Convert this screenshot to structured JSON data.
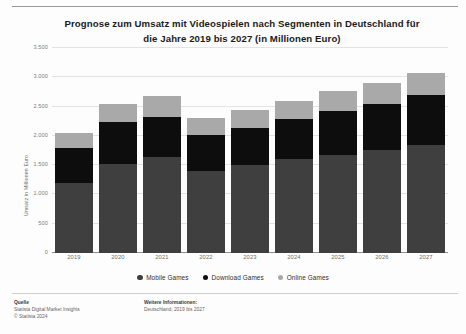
{
  "title": {
    "line1": "Prognose zum Umsatz mit Videospielen nach Segmenten in Deutschland für",
    "line2": "die Jahre 2019 bis 2027 (in Millionen Euro)"
  },
  "legend": [
    {
      "label": "Mobile Games",
      "color": "#3f3f3f",
      "icon": "legend-dot-icon"
    },
    {
      "label": "Download Games",
      "color": "#0d0d0d",
      "icon": "legend-dot-icon"
    },
    {
      "label": "Online Games",
      "color": "#a9a9a9",
      "icon": "legend-dot-icon"
    }
  ],
  "footer": {
    "source_head": "Quelle",
    "source_line1": "Statista Digital Market Insights",
    "source_line2": "© Statista 2024",
    "info_head": "Weitere Informationen:",
    "info_line1": "Deutschland; 2019 bis 2027"
  },
  "chart_data": {
    "type": "bar",
    "stacked": true,
    "title": "Prognose zum Umsatz mit Videospielen nach Segmenten in Deutschland für die Jahre 2019 bis 2027 (in Millionen Euro)",
    "xlabel": "",
    "ylabel": "Umsatz in Millionen Euro",
    "ylim": [
      0,
      3500
    ],
    "yticks": [
      0,
      500,
      1000,
      1500,
      2000,
      2500,
      3000,
      3500
    ],
    "ytick_labels": [
      "0",
      "500",
      "1.000",
      "1.500",
      "2.000",
      "2.500",
      "3.000",
      "3.500"
    ],
    "grid": true,
    "legend_position": "bottom",
    "categories": [
      "2019",
      "2020",
      "2021",
      "2022",
      "2023",
      "2024",
      "2025",
      "2026",
      "2027"
    ],
    "series": [
      {
        "name": "Mobile Games",
        "color": "#3f3f3f",
        "values": [
          1200,
          1520,
          1640,
          1400,
          1500,
          1600,
          1680,
          1760,
          1850
        ]
      },
      {
        "name": "Download Games",
        "color": "#0d0d0d",
        "values": [
          600,
          720,
          690,
          620,
          640,
          680,
          740,
          790,
          840
        ]
      },
      {
        "name": "Online Games",
        "color": "#a9a9a9",
        "values": [
          250,
          310,
          350,
          290,
          300,
          320,
          350,
          360,
          380
        ]
      }
    ],
    "totals": [
      2050,
      2550,
      2680,
      2310,
      2440,
      2600,
      2770,
      2910,
      3070
    ]
  }
}
